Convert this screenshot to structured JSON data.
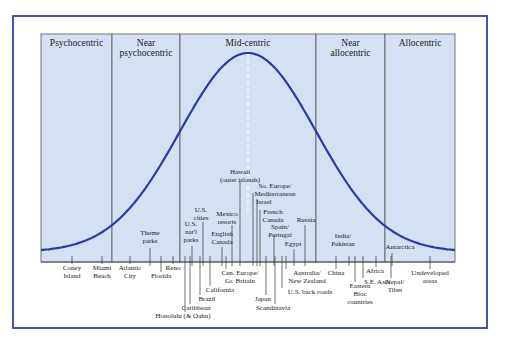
{
  "diagram": {
    "type": "bell-curve-typology",
    "curve_color": "#2a3aa8",
    "region_fill": "#d5e1f2",
    "frame_color": "#4a55a8",
    "segments": [
      {
        "label_lines": [
          "Psychocentric"
        ],
        "x0": 41,
        "x1": 112
      },
      {
        "label_lines": [
          "Near",
          "psychocentric"
        ],
        "x0": 112,
        "x1": 180
      },
      {
        "label_lines": [
          "Mid-centric"
        ],
        "x0": 180,
        "x1": 316
      },
      {
        "label_lines": [
          "Near",
          "allocentric"
        ],
        "x0": 316,
        "x1": 385
      },
      {
        "label_lines": [
          "Allocentric"
        ],
        "x0": 385,
        "x1": 455
      }
    ],
    "destinations_above_axis": [
      {
        "lines": [
          "Hawaii",
          "(outer islands)"
        ],
        "x": 240,
        "y": 174,
        "tick_x": 240,
        "tick_top": 181
      },
      {
        "lines": [
          "So. Europe/",
          "Mediterranean"
        ],
        "x": 275,
        "y": 188,
        "tick_x": 253,
        "tick_top": 193
      },
      {
        "lines": [
          "Israel"
        ],
        "x": 264,
        "y": 204,
        "tick_x": 257,
        "tick_top": 199
      },
      {
        "lines": [
          "French",
          "Canada"
        ],
        "x": 273,
        "y": 214,
        "tick_x": 260,
        "tick_top": 210
      },
      {
        "lines": [
          "Russia"
        ],
        "x": 306,
        "y": 222,
        "tick_x": 305,
        "tick_top": 225
      },
      {
        "lines": [
          "Spain/",
          "Portugal"
        ],
        "x": 280,
        "y": 229,
        "tick_x": 274,
        "tick_top": 235
      },
      {
        "lines": [
          "Egypt"
        ],
        "x": 293,
        "y": 246,
        "tick_x": 294,
        "tick_top": 249
      },
      {
        "lines": [
          "U.S.",
          "cities"
        ],
        "x": 201,
        "y": 212,
        "tick_x": 203,
        "tick_top": 222
      },
      {
        "lines": [
          "Mexico",
          "resorts"
        ],
        "x": 227,
        "y": 216,
        "tick_x": 232,
        "tick_top": 225
      },
      {
        "lines": [
          "U.S.",
          "nat'l",
          "parks"
        ],
        "x": 191,
        "y": 226,
        "tick_x": 192,
        "tick_top": 246
      },
      {
        "lines": [
          "English",
          "Canada"
        ],
        "x": 222,
        "y": 236,
        "tick_x": 222,
        "tick_top": 247
      },
      {
        "lines": [
          "Theme",
          "parks"
        ],
        "x": 150,
        "y": 235,
        "tick_x": 150,
        "tick_top": 248
      },
      {
        "lines": [
          "India/",
          "Pakistan"
        ],
        "x": 343,
        "y": 238,
        "tick_x": 349,
        "tick_top": 256
      },
      {
        "lines": [
          "Antarctica"
        ],
        "x": 400,
        "y": 249,
        "tick_x": 392,
        "tick_top": 253
      }
    ],
    "destinations_below_axis": [
      {
        "lines": [
          "Coney",
          "Island"
        ],
        "x": 72,
        "y": 270,
        "tick_x": 72
      },
      {
        "lines": [
          "Miami",
          "Beach"
        ],
        "x": 102,
        "y": 270,
        "tick_x": 102
      },
      {
        "lines": [
          "Atlantic",
          "City"
        ],
        "x": 130,
        "y": 270,
        "tick_x": 130
      },
      {
        "lines": [
          "Florida"
        ],
        "x": 161,
        "y": 278,
        "tick_x": 161
      },
      {
        "lines": [
          "Reno"
        ],
        "x": 173,
        "y": 270,
        "tick_x": 173
      },
      {
        "lines": [
          "Honolulu (& Oahu)"
        ],
        "x": 183,
        "y": 318,
        "tick_x": 185
      },
      {
        "lines": [
          "Caribbean"
        ],
        "x": 196,
        "y": 310,
        "tick_x": 190
      },
      {
        "lines": [
          "Brazil"
        ],
        "x": 207,
        "y": 301,
        "tick_x": 200
      },
      {
        "lines": [
          "California"
        ],
        "x": 220,
        "y": 292,
        "tick_x": 210
      },
      {
        "lines": [
          "Cen. Europe/",
          "Gr. Britain"
        ],
        "x": 240,
        "y": 275,
        "tick_x": 226
      },
      {
        "lines": [
          "Japan"
        ],
        "x": 263,
        "y": 301,
        "tick_x": 266
      },
      {
        "lines": [
          "Scandinavia"
        ],
        "x": 273,
        "y": 310,
        "tick_x": 275
      },
      {
        "lines": [
          "Australia/",
          "New Zealand"
        ],
        "x": 307,
        "y": 275,
        "tick_x": 286
      },
      {
        "lines": [
          "U.S. back roads"
        ],
        "x": 310,
        "y": 294,
        "tick_x": 282
      },
      {
        "lines": [
          "China"
        ],
        "x": 336,
        "y": 275,
        "tick_x": 336
      },
      {
        "lines": [
          "Eastern",
          "Bloc",
          "countries"
        ],
        "x": 360,
        "y": 288,
        "tick_x": 355
      },
      {
        "lines": [
          "S.E. Asia"
        ],
        "x": 377,
        "y": 284,
        "tick_x": 363
      },
      {
        "lines": [
          "Africa"
        ],
        "x": 375,
        "y": 273,
        "tick_x": 376
      },
      {
        "lines": [
          "Nepal/",
          "Tibet"
        ],
        "x": 395,
        "y": 284,
        "tick_x": 391
      },
      {
        "lines": [
          "Undeveloped",
          "areas"
        ],
        "x": 430,
        "y": 275,
        "tick_x": 430
      }
    ]
  }
}
